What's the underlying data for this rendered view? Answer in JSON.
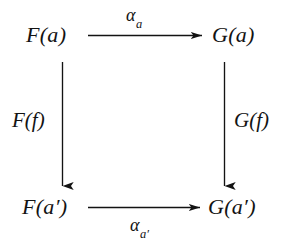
{
  "diagram": {
    "kind": "commutative-square",
    "background_color": "#ffffff",
    "ink_color": "#131313",
    "nodes": [
      {
        "id": "top-left",
        "text": "F(a)",
        "functor": "F",
        "argument": "a",
        "primed": false
      },
      {
        "id": "top-right",
        "text": "G(a)",
        "functor": "G",
        "argument": "a",
        "primed": false
      },
      {
        "id": "bottom-left",
        "text": "F(a′)",
        "functor": "F",
        "argument": "a′",
        "primed": true
      },
      {
        "id": "bottom-right",
        "text": "G(a′)",
        "functor": "G",
        "argument": "a′",
        "primed": true
      }
    ],
    "edges": [
      {
        "id": "top-edge",
        "from": "top-left",
        "to": "top-right",
        "orientation": "horizontal",
        "direction": "right",
        "label_base": "α",
        "label_subscript": "a",
        "label_text": "αa"
      },
      {
        "id": "bottom-edge",
        "from": "bottom-left",
        "to": "bottom-right",
        "orientation": "horizontal",
        "direction": "right",
        "label_base": "α",
        "label_subscript": "a′",
        "label_text": "αa′"
      },
      {
        "id": "left-edge",
        "from": "top-left",
        "to": "bottom-left",
        "orientation": "vertical",
        "direction": "down",
        "label_base": "F(f)",
        "label_subscript": "",
        "label_text": "F(f)"
      },
      {
        "id": "right-edge",
        "from": "top-right",
        "to": "bottom-right",
        "orientation": "vertical",
        "direction": "down",
        "label_base": "G(f)",
        "label_subscript": "",
        "label_text": "G(f)"
      }
    ]
  }
}
